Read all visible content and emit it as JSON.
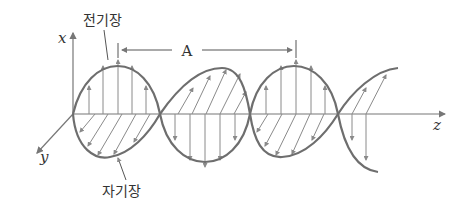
{
  "labels": {
    "electric_field": "전기장",
    "magnetic_field": "자기장",
    "wavelength": "A",
    "axis_x": "x",
    "axis_y": "y",
    "axis_z": "z"
  },
  "colors": {
    "curve": "#6e6e6e",
    "vector": "#8a8a8a",
    "axis": "#777777",
    "text": "#333333"
  },
  "geometry": {
    "origin": [
      73,
      114
    ],
    "amplitude_E": 57,
    "zero_crossings_z": [
      73,
      160,
      250,
      338
    ],
    "E_peaks_z": [
      118,
      296
    ],
    "wavelength_marker": {
      "from_z": 118,
      "to_z": 296,
      "y": 50
    }
  }
}
